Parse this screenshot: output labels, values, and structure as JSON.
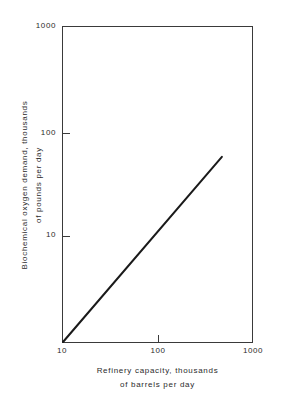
{
  "chart_data": {
    "type": "line",
    "title": "",
    "xlabel": "Refinery capacity, thousands of barrels per day",
    "ylabel": "Biochemical oxygen demand, thousands of pounds per day",
    "xscale": "log",
    "yscale": "log",
    "xlim": [
      10,
      1000
    ],
    "ylim": [
      1,
      1000
    ],
    "grid": false,
    "legend": false,
    "xticks": [
      {
        "value": 10,
        "label": "10"
      },
      {
        "value": 100,
        "label": "100"
      },
      {
        "value": 1000,
        "label": "1000"
      }
    ],
    "yticks": [
      {
        "value": 10,
        "label": "10"
      },
      {
        "value": 100,
        "label": "100"
      },
      {
        "value": 1000,
        "label": "1000"
      }
    ],
    "series": [
      {
        "name": "BOD vs refinery capacity",
        "style": "solid-line",
        "color": "#1a1a1a",
        "x": [
          10,
          480
        ],
        "y": [
          1,
          58
        ]
      }
    ],
    "annotations": []
  },
  "axes": {
    "y_title_lines": [
      "Biochemical oxygen demand, thousands",
      "of  pounds  per  day"
    ],
    "x_title_lines": [
      "Refinery  capacity,  thousands",
      "of  barrels  per  day"
    ],
    "y_tick_labels": [
      "1000",
      "100",
      "10"
    ],
    "x_tick_labels": [
      "10",
      "100",
      "1000"
    ]
  },
  "colors": {
    "axis": "#3a3a3a",
    "line": "#1a1a1a",
    "text": "#2b2b2b",
    "background": "#ffffff"
  }
}
